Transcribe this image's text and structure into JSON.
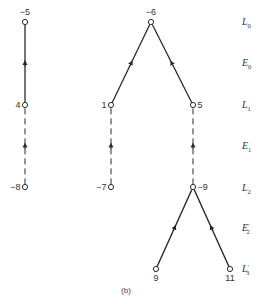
{
  "diagram": {
    "caption": "(b)",
    "nodes": [
      {
        "id": "n-5",
        "label": "−5",
        "x": 25,
        "y": 22,
        "label_pos": "top"
      },
      {
        "id": "n4",
        "label": "4",
        "x": 25,
        "y": 105,
        "label_pos": "left"
      },
      {
        "id": "n-8",
        "label": "−8",
        "x": 25,
        "y": 187,
        "label_pos": "left"
      },
      {
        "id": "n1",
        "label": "1",
        "x": 111,
        "y": 105,
        "label_pos": "left"
      },
      {
        "id": "n-7",
        "label": "−7",
        "x": 111,
        "y": 187,
        "label_pos": "left"
      },
      {
        "id": "n-6",
        "label": "−6",
        "x": 151,
        "y": 22,
        "label_pos": "top"
      },
      {
        "id": "n5",
        "label": "5",
        "x": 193,
        "y": 105,
        "label_pos": "right"
      },
      {
        "id": "n-9",
        "label": "−9",
        "x": 193,
        "y": 187,
        "label_pos": "right"
      },
      {
        "id": "n9",
        "label": "9",
        "x": 156,
        "y": 269,
        "label_pos": "bottom"
      },
      {
        "id": "n11",
        "label": "11",
        "x": 230,
        "y": 269,
        "label_pos": "bottom"
      }
    ],
    "edges": [
      {
        "from": "n4",
        "to": "n-5",
        "style": "solid"
      },
      {
        "from": "n-8",
        "to": "n4",
        "style": "dashed"
      },
      {
        "from": "n1",
        "to": "n-6",
        "style": "solid"
      },
      {
        "from": "n5",
        "to": "n-6",
        "style": "solid"
      },
      {
        "from": "n-7",
        "to": "n1",
        "style": "dashed"
      },
      {
        "from": "n-9",
        "to": "n5",
        "style": "dashed"
      },
      {
        "from": "n9",
        "to": "n-9",
        "style": "solid"
      },
      {
        "from": "n11",
        "to": "n-9",
        "style": "solid"
      }
    ],
    "levels": [
      {
        "base": "L",
        "sub": "0",
        "prime": "",
        "y": 22
      },
      {
        "base": "E",
        "sub": "0",
        "prime": "",
        "y": 63
      },
      {
        "base": "L",
        "sub": "1",
        "prime": "",
        "y": 105
      },
      {
        "base": "E",
        "sub": "1",
        "prime": "",
        "y": 146
      },
      {
        "base": "L",
        "sub": "2",
        "prime": "",
        "y": 188
      },
      {
        "base": "E",
        "sub": "2",
        "prime": "′",
        "y": 228
      },
      {
        "base": "L",
        "sub": "3",
        "prime": "′",
        "y": 269
      }
    ],
    "colors": {
      "line": "#2a2a2a",
      "node_fill": "#ffffff",
      "text": "#333333"
    }
  }
}
